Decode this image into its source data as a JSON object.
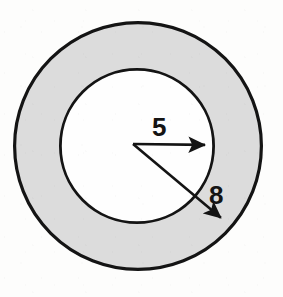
{
  "figure": {
    "background_color": "#fdfdfc",
    "stroke_color": "#141414",
    "band_fill_color": "#dcdcdc",
    "hole_fill_color": "#fefefe"
  },
  "labels": {
    "inner_radius": "5",
    "outer_radius": "8"
  },
  "chart_data": {
    "type": "diagram",
    "shape": "annulus",
    "center": {
      "x": 137,
      "y": 146
    },
    "circles": [
      {
        "name": "outer-circle",
        "radius_px": 125,
        "radius_value": 8,
        "fill": "#dcdcdc",
        "stroke": "#141414",
        "stroke_width_px": 3.2
      },
      {
        "name": "inner-circle",
        "radius_px": 78,
        "radius_value": 5,
        "fill": "#fefefe",
        "stroke": "#141414",
        "stroke_width_px": 2.8
      }
    ],
    "arrows": [
      {
        "name": "inner-radius-arrow",
        "label": "5",
        "value": 5,
        "from": {
          "x": 133,
          "y": 144
        },
        "to": {
          "x": 213,
          "y": 145
        },
        "direction": "right",
        "label_position": {
          "x": 162,
          "y": 127
        }
      },
      {
        "name": "outer-radius-arrow",
        "label": "8",
        "value": 8,
        "from": {
          "x": 133,
          "y": 144
        },
        "to": {
          "x": 227,
          "y": 223
        },
        "direction": "down-right",
        "label_position": {
          "x": 218,
          "y": 195
        }
      }
    ],
    "legend": null,
    "grid": false,
    "axes": false
  }
}
